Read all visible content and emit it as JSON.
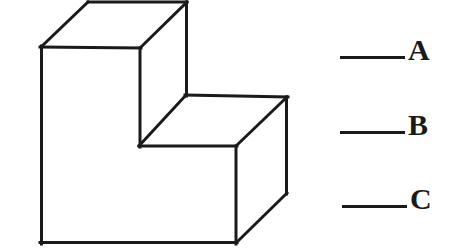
{
  "figure": {
    "name": "stepped-block-isometric-drawing",
    "type": "line-drawing",
    "stroke_color": "#1a1a1a",
    "fill_color": "#ffffff",
    "background_color": "#ffffff",
    "stroke_width": 3,
    "surfaces": [
      {
        "id": "top-upper-face",
        "points": "41,47 88,2 187,2 140,48"
      },
      {
        "id": "front-left-face",
        "points": "41,47 140,48 140,146 236,146 236,243 41,243"
      },
      {
        "id": "step-top-face",
        "points": "140,146 186,95 287,97 236,146"
      },
      {
        "id": "right-side-face",
        "points": "236,146 287,97 287,193 236,243"
      },
      {
        "id": "upper-block-right-face",
        "points": "140,48 187,2 187,95 186,95"
      }
    ],
    "edges": [
      {
        "id": "top-face-left-edge",
        "x1": 41,
        "y1": 47,
        "x2": 88,
        "y2": 2
      },
      {
        "id": "top-face-back-edge",
        "x1": 88,
        "y1": 2,
        "x2": 187,
        "y2": 2
      },
      {
        "id": "top-face-front-edge",
        "x1": 41,
        "y1": 47,
        "x2": 140,
        "y2": 48
      },
      {
        "id": "top-face-right-edge",
        "x1": 140,
        "y1": 48,
        "x2": 187,
        "y2": 2
      },
      {
        "id": "upper-block-right-vertical-edge",
        "x1": 187,
        "y1": 2,
        "x2": 187,
        "y2": 95
      },
      {
        "id": "upper-block-front-vertical-edge",
        "x1": 140,
        "y1": 48,
        "x2": 140,
        "y2": 146
      },
      {
        "id": "step-top-back-edge",
        "x1": 187,
        "y1": 95,
        "x2": 287,
        "y2": 97
      },
      {
        "id": "step-top-left-edge",
        "x1": 187,
        "y1": 95,
        "x2": 140,
        "y2": 146
      },
      {
        "id": "step-top-front-edge",
        "x1": 140,
        "y1": 146,
        "x2": 236,
        "y2": 146
      },
      {
        "id": "step-top-right-edge",
        "x1": 236,
        "y1": 146,
        "x2": 287,
        "y2": 97
      },
      {
        "id": "right-face-vertical-edge",
        "x1": 287,
        "y1": 97,
        "x2": 287,
        "y2": 193
      },
      {
        "id": "front-right-vertical-edge",
        "x1": 236,
        "y1": 146,
        "x2": 236,
        "y2": 243
      },
      {
        "id": "bottom-right-diagonal-edge",
        "x1": 236,
        "y1": 243,
        "x2": 287,
        "y2": 193
      },
      {
        "id": "front-left-vertical-edge",
        "x1": 41,
        "y1": 47,
        "x2": 41,
        "y2": 243
      },
      {
        "id": "bottom-front-edge",
        "x1": 41,
        "y1": 243,
        "x2": 236,
        "y2": 243
      }
    ]
  },
  "answers": {
    "items": [
      {
        "id": "answer-a",
        "label": "A"
      },
      {
        "id": "answer-b",
        "label": "B"
      },
      {
        "id": "answer-c",
        "label": "C"
      }
    ]
  }
}
